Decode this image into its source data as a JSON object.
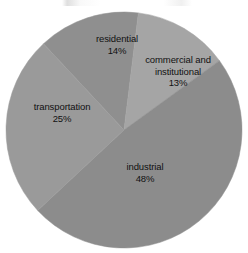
{
  "chart_data": {
    "type": "pie",
    "title": "",
    "subtitle": "",
    "xlabel": "",
    "ylabel": "",
    "legend_position": "none",
    "grid": false,
    "labels_inside_slices": true,
    "categories": [
      "residential",
      "commercial and institutional",
      "industrial",
      "transportation"
    ],
    "values": [
      14,
      13,
      48,
      25
    ],
    "units": "%",
    "slices": [
      {
        "name": "residential",
        "label_line1": "residential",
        "label_line2": "",
        "percent_text": "14%",
        "value": 14,
        "color": "#8f8f8f",
        "start_angle_deg": 317,
        "end_angle_deg": 7
      },
      {
        "name": "commercial and institutional",
        "label_line1": "commercial and",
        "label_line2": "institutional",
        "percent_text": "13%",
        "value": 13,
        "color": "#a5a5a5",
        "start_angle_deg": 7,
        "end_angle_deg": 54
      },
      {
        "name": "industrial",
        "label_line1": "industrial",
        "label_line2": "",
        "percent_text": "48%",
        "value": 48,
        "color": "#8c8c8c",
        "start_angle_deg": 54,
        "end_angle_deg": 227
      },
      {
        "name": "transportation",
        "label_line1": "transportation",
        "label_line2": "",
        "percent_text": "25%",
        "value": 25,
        "color": "#9a9a9a",
        "start_angle_deg": 227,
        "end_angle_deg": 317
      }
    ],
    "geometry": {
      "center_x": 124,
      "center_y": 130,
      "radius": 118
    },
    "background_color": "#ffffff",
    "label_color": "#111111"
  }
}
